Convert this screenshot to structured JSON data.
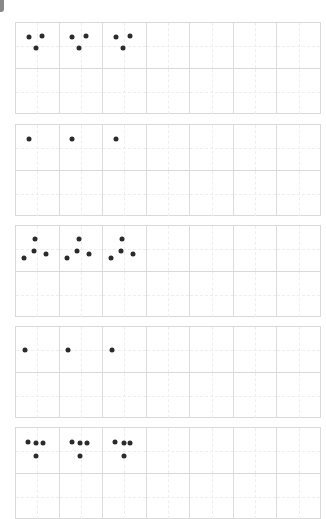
{
  "worksheet": {
    "title": "",
    "columns_per_row": 7,
    "rows_per_block": 2,
    "ink_color": "#2b2b2b",
    "grid_color": "#d9d9d9",
    "blocks": [
      {
        "name": "three-dots-v",
        "pattern_copies": 3,
        "dot_count": 3,
        "pattern": [
          [
            0.3,
            0.3
          ],
          [
            0.62,
            0.28
          ],
          [
            0.46,
            0.55
          ]
        ]
      },
      {
        "name": "single-dot",
        "pattern_copies": 3,
        "dot_count": 1,
        "pattern": [
          [
            0.3,
            0.3
          ]
        ]
      },
      {
        "name": "four-dots-arrow",
        "pattern_copies": 3,
        "dot_count": 4,
        "pattern": [
          [
            0.45,
            0.28
          ],
          [
            0.42,
            0.55
          ],
          [
            0.18,
            0.72
          ],
          [
            0.7,
            0.62
          ]
        ]
      },
      {
        "name": "single-dot-mid",
        "pattern_copies": 3,
        "dot_count": 1,
        "pattern": [
          [
            0.2,
            0.5
          ]
        ]
      },
      {
        "name": "four-dots-t",
        "pattern_copies": 3,
        "dot_count": 4,
        "pattern": [
          [
            0.28,
            0.3
          ],
          [
            0.48,
            0.34
          ],
          [
            0.64,
            0.34
          ],
          [
            0.48,
            0.62
          ]
        ]
      }
    ]
  }
}
